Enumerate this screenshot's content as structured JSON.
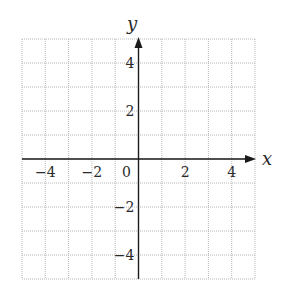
{
  "chart_data": {
    "type": "scatter",
    "title": "",
    "xlabel": "x",
    "ylabel": "y",
    "xlim": [
      -5,
      5
    ],
    "ylim": [
      -5,
      5
    ],
    "grid": true,
    "grid_style": "dotted",
    "grid_step": 1,
    "x_ticks": [
      {
        "value": -4,
        "label": "−4"
      },
      {
        "value": -2,
        "label": "−2"
      },
      {
        "value": 0,
        "label": "0"
      },
      {
        "value": 2,
        "label": "2"
      },
      {
        "value": 4,
        "label": "4"
      }
    ],
    "y_ticks": [
      {
        "value": 4,
        "label": "4"
      },
      {
        "value": 2,
        "label": "2"
      },
      {
        "value": -2,
        "label": "−2"
      },
      {
        "value": -4,
        "label": "−4"
      }
    ],
    "series": [],
    "legend": null
  },
  "colors": {
    "axis": "#1a1a1a",
    "grid": "#b8b8b8",
    "text": "#2a2a2a",
    "background": "#ffffff"
  }
}
